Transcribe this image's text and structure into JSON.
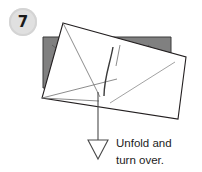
{
  "diagram": {
    "kind": "origami-instruction-step",
    "step_badge": {
      "label": "7",
      "shape": "circle",
      "fill": "#e0e0e0",
      "ring": "#d0d0d0",
      "text_color": "#1a1a1a",
      "cx": 23,
      "cy": 22,
      "r": 14
    },
    "back_layer": {
      "name": "gray-paper-layer",
      "fill": "#808080",
      "stroke": "#3a3a3a",
      "points": "43,37 171,37 171,88 43,88",
      "corner_creases": [
        "52,45 66,56",
        "148,45 162,56"
      ]
    },
    "front_layer": {
      "name": "white-paper-sheet",
      "fill": "#ffffff",
      "stroke": "#231f20",
      "points": "63,23 186,57 178,119 42,98"
    },
    "creases": [
      {
        "name": "crease-left-diagonal",
        "path": "63,23 100,97",
        "color": "#6e6e6e",
        "width": 0.8
      },
      {
        "name": "crease-left-lower",
        "path": "42,98 117,79",
        "color": "#6e6e6e",
        "width": 0.8
      },
      {
        "name": "crease-top-edge-fold",
        "path": "63,23 186,57",
        "color": "#3a3a3a",
        "width": 1.0
      },
      {
        "name": "crease-center-vertical",
        "path": "113,47 104,96",
        "color": "#3a3a3a",
        "width": 1.4
      },
      {
        "name": "crease-center-short",
        "path": "120,45 116,66",
        "color": "#6e6e6e",
        "width": 0.8
      },
      {
        "name": "crease-right-diagonal",
        "path": "110,103 175,62",
        "color": "#8a8a8a",
        "width": 0.8
      },
      {
        "name": "crease-bottom-left-sliver",
        "path": "42,98 96,100",
        "color": "#6e6e6e",
        "width": 0.8
      }
    ],
    "arrow": {
      "name": "unfold-arrow",
      "direction": "down",
      "stroke": "#4a4a4a",
      "fill": "#ffffff",
      "shaft": "98,92 98,141",
      "head": "88,140 108,140 98,159"
    },
    "caption": {
      "line1": "Unfold and",
      "line2": "turn over.",
      "x": 116,
      "y1": 147,
      "y2": 164
    }
  }
}
